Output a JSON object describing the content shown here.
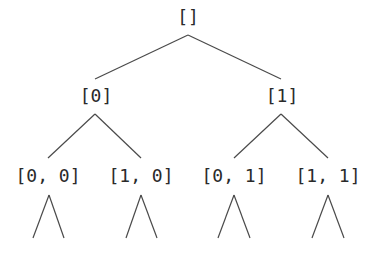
{
  "diagram": {
    "type": "binary-tree",
    "line_color": "#4a4a4a",
    "text_color": "#2a2a2a",
    "nodes": [
      {
        "id": "root",
        "label": "[]",
        "x": 188,
        "y": 7
      },
      {
        "id": "n0",
        "label": "[0]",
        "x": 96,
        "y": 86
      },
      {
        "id": "n1",
        "label": "[1]",
        "x": 282,
        "y": 86
      },
      {
        "id": "n00",
        "label": "[0, 0]",
        "x": 48,
        "y": 166
      },
      {
        "id": "n10",
        "label": "[1, 0]",
        "x": 141,
        "y": 166
      },
      {
        "id": "n01",
        "label": "[0, 1]",
        "x": 234,
        "y": 166
      },
      {
        "id": "n11",
        "label": "[1, 1]",
        "x": 328,
        "y": 166
      }
    ],
    "edges": [
      {
        "from": "root",
        "to": "n0",
        "x1": 188,
        "y1": 35,
        "x2": 95,
        "y2": 79
      },
      {
        "from": "root",
        "to": "n1",
        "x1": 188,
        "y1": 35,
        "x2": 281,
        "y2": 79
      },
      {
        "from": "n0",
        "to": "n00",
        "x1": 95,
        "y1": 114,
        "x2": 48,
        "y2": 158
      },
      {
        "from": "n0",
        "to": "n10",
        "x1": 95,
        "y1": 114,
        "x2": 141,
        "y2": 158
      },
      {
        "from": "n1",
        "to": "n01",
        "x1": 281,
        "y1": 114,
        "x2": 234,
        "y2": 158
      },
      {
        "from": "n1",
        "to": "n11",
        "x1": 281,
        "y1": 114,
        "x2": 328,
        "y2": 158
      },
      {
        "from": "n00",
        "to": "leaf",
        "x1": 49,
        "y1": 195,
        "x2": 33,
        "y2": 238
      },
      {
        "from": "n00",
        "to": "leaf",
        "x1": 49,
        "y1": 195,
        "x2": 64,
        "y2": 238
      },
      {
        "from": "n10",
        "to": "leaf",
        "x1": 141,
        "y1": 195,
        "x2": 126,
        "y2": 238
      },
      {
        "from": "n10",
        "to": "leaf",
        "x1": 141,
        "y1": 195,
        "x2": 157,
        "y2": 238
      },
      {
        "from": "n01",
        "to": "leaf",
        "x1": 234,
        "y1": 195,
        "x2": 218,
        "y2": 238
      },
      {
        "from": "n01",
        "to": "leaf",
        "x1": 234,
        "y1": 195,
        "x2": 250,
        "y2": 238
      },
      {
        "from": "n11",
        "to": "leaf",
        "x1": 328,
        "y1": 195,
        "x2": 312,
        "y2": 238
      },
      {
        "from": "n11",
        "to": "leaf",
        "x1": 328,
        "y1": 195,
        "x2": 344,
        "y2": 238
      }
    ]
  }
}
